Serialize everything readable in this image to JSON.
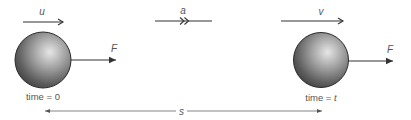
{
  "diagram": {
    "title": "",
    "initial_state": {
      "velocity_label": "u",
      "force_label": "F",
      "time_label_prefix": "time = ",
      "time_value": "0"
    },
    "acceleration": {
      "label": "a"
    },
    "final_state": {
      "velocity_label": "v",
      "force_label": "F",
      "time_label_prefix": "time = ",
      "time_value": "t"
    },
    "displacement": {
      "label": "s"
    },
    "colors": {
      "line": "#333333",
      "text": "#555555",
      "sphere_light": "#d9d9d9",
      "sphere_dark": "#3a3a3a"
    }
  }
}
